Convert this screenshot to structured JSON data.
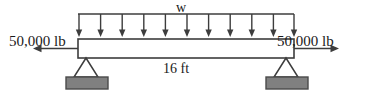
{
  "diagram": {
    "type": "beam-free-body-diagram",
    "labels": {
      "distributed_load": "w",
      "span": "16 ft",
      "axial_force_left": "50,000 lb",
      "axial_force_right": "50,000 lb"
    },
    "values": {
      "span_length": 16,
      "span_units": "ft",
      "axial_force": 50000,
      "axial_force_units": "lb",
      "distributed_load_symbol": "w",
      "load_arrow_count": 11
    },
    "colors": {
      "line": "#3d3d3d",
      "support_block_fill": "#808080",
      "support_block_stroke": "#4a4a4a",
      "text": "#1a1a1a",
      "background": "#ffffff"
    },
    "geometry": {
      "beam_left_x": 78,
      "beam_right_x": 294,
      "beam_top_y": 39,
      "beam_bottom_y": 58,
      "load_line_y": 14,
      "support_left_x": 86,
      "support_right_x": 286
    }
  }
}
